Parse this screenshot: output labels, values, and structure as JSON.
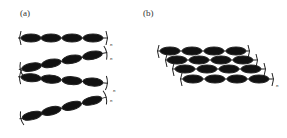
{
  "figure": {
    "panels": [
      {
        "id": "a",
        "label": "(a)",
        "description": "zigzag stacked chains",
        "subscript": "n",
        "chains": 4,
        "units_per_chain": 4
      },
      {
        "id": "b",
        "label": "(b)",
        "description": "layered sheet of chains",
        "subscript": "n",
        "rows": 4,
        "units_per_row": 4
      }
    ],
    "colors": {
      "unit": "#111111",
      "bond": "#222222",
      "background": "#ffffff"
    }
  }
}
